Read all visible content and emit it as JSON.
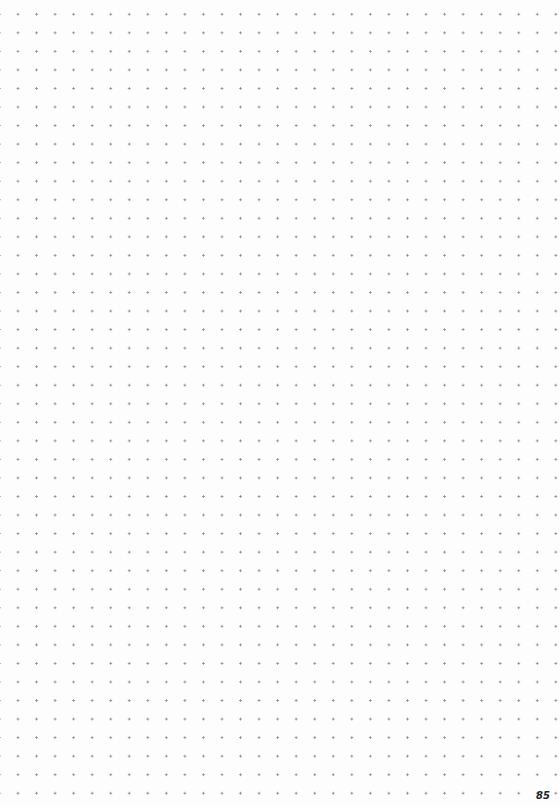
{
  "page": {
    "type": "dot-grid notebook page",
    "page_number": "85",
    "dot_color": "#8a8a8a",
    "background_color": "#fdfdfd"
  }
}
